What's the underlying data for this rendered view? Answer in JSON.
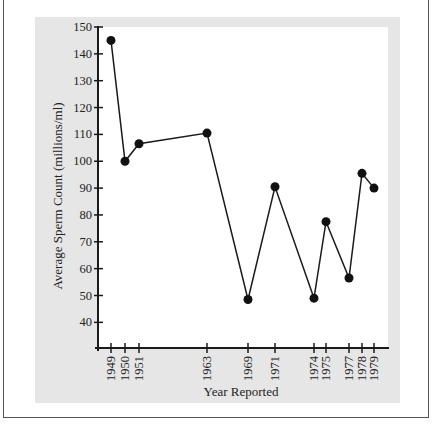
{
  "chart_data": {
    "type": "line",
    "title": "",
    "xlabel": "Year Reported",
    "ylabel": "Average Sperm Count (millions/ml)",
    "x": [
      "1949",
      "1950",
      "1951",
      "1963",
      "1969",
      "1971",
      "1974",
      "1975",
      "1977",
      "1978",
      "1979"
    ],
    "values": [
      145,
      100,
      106.5,
      110.5,
      48.5,
      90.5,
      49,
      77.5,
      56.5,
      95.5,
      90
    ],
    "yticks": [
      40,
      50,
      60,
      70,
      80,
      90,
      100,
      110,
      120,
      130,
      140,
      150
    ],
    "ylim": [
      30,
      150
    ],
    "grid": false,
    "legend": null,
    "markers": "filled-circle",
    "colors": {
      "line": "#1a1a1a",
      "panel": "#e6e6e6",
      "plot_bg": "#ffffff",
      "frame": "#555555"
    }
  },
  "layout_px": {
    "x_positions": [
      111,
      125,
      139,
      207,
      248,
      275,
      314,
      326,
      349,
      362,
      374
    ]
  }
}
